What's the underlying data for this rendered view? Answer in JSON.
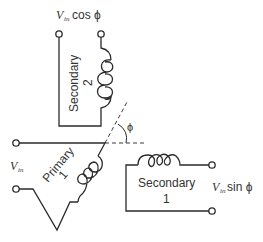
{
  "diagram": {
    "type": "resolver-transformer",
    "colors": {
      "line": "#2b2b2b",
      "text": "#333333",
      "background": "#ffffff"
    },
    "labels": {
      "top_output": {
        "v": "V",
        "sub": "in",
        "rest": " cos ϕ"
      },
      "right_output": {
        "v": "V",
        "sub": "in",
        "rest": " sin ϕ"
      },
      "input": {
        "v": "V",
        "sub": "in"
      },
      "secondary2": {
        "name": "Secondary",
        "num": "2"
      },
      "secondary1": {
        "name": "Secondary",
        "num": "1"
      },
      "primary": {
        "name": "Primary",
        "num": "1"
      },
      "angle": "ϕ"
    }
  }
}
